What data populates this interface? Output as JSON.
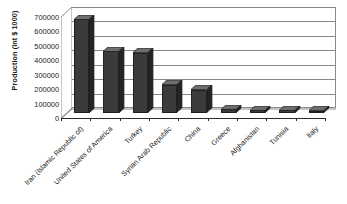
{
  "chart_data": {
    "type": "bar",
    "title": "",
    "subtitle": "",
    "xlabel": "",
    "ylabel": "Production (Int $ 1000)",
    "ylim": [
      0,
      700000
    ],
    "ytick_step": 100000,
    "yticks": [
      {
        "value": 700000,
        "label": "700000"
      },
      {
        "value": 600000,
        "label": "600000"
      },
      {
        "value": 500000,
        "label": "500000"
      },
      {
        "value": 400000,
        "label": "400000"
      },
      {
        "value": 300000,
        "label": "300000"
      },
      {
        "value": 200000,
        "label": "200000"
      },
      {
        "value": 100000,
        "label": "100000"
      },
      {
        "value": 0,
        "label": "0"
      }
    ],
    "grid": true,
    "legend": "none",
    "style": "3d-column",
    "categories": [
      "Iran (Islamic Republic of)",
      "United States of America",
      "Turkey",
      "Syrian Arab Republic",
      "China",
      "Greece",
      "Afghanistan",
      "Tunisia",
      "Italy"
    ],
    "values": [
      648000,
      425000,
      415000,
      192000,
      158000,
      22000,
      16000,
      15000,
      13000
    ],
    "series": [
      {
        "name": "Production",
        "values": [
          648000,
          425000,
          415000,
          192000,
          158000,
          22000,
          16000,
          15000,
          13000
        ]
      }
    ],
    "colors": {
      "bar_front": "#3b3b3b",
      "bar_top": "#6e6e6e",
      "bar_side": "#242424",
      "bar_outline": "#202020",
      "gridline": "#8a8a8a",
      "axis": "#2a2a2a",
      "text": "#1a1a1a",
      "background": "#ffffff"
    }
  }
}
